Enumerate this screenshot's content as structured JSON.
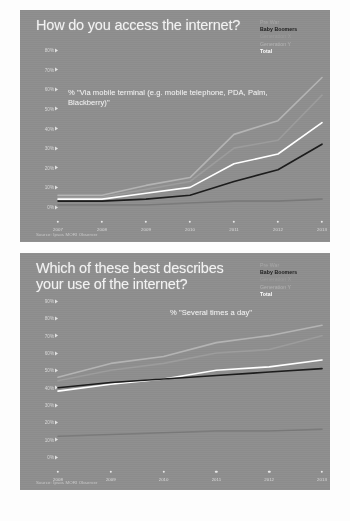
{
  "page": {
    "background_color": "#fdfdfd",
    "panel_color": "#8e8e8e"
  },
  "legend_colors": {
    "pre_war": "#a8a8a8",
    "baby_boomers": "#1c1c1c",
    "generation_x": "#9c9c9c",
    "generation_y": "#b4b4b4",
    "total": "#ffffff"
  },
  "slide1": {
    "title": "How do you access the internet?",
    "annotation": "% \"Via mobile terminal (e.g. mobile telephone, PDA, Palm, Blackberry)\"",
    "source": "Source: Ipsos MORI Observer",
    "legend": {
      "pre_war": "Pre War",
      "baby_boomers": "Baby Boomers",
      "generation_x": "Generation X",
      "generation_y": "Generation Y",
      "total": "Total"
    }
  },
  "slide2": {
    "title": "Which of these best describes your use of the internet?",
    "annotation": "% \"Several times a day\"",
    "source": "Source: Ipsos MORI Observer",
    "legend": {
      "pre_war": "Pre War",
      "baby_boomers": "Baby Boomers",
      "generation_x": "Generation X",
      "generation_y": "Generation Y",
      "total": "Total"
    }
  },
  "chart_data": [
    {
      "type": "line",
      "title": "How do you access the internet?",
      "subtitle": "% \"Via mobile terminal (e.g. mobile telephone, PDA, Palm, Blackberry)\"",
      "xlabel": "",
      "ylabel": "%",
      "x": [
        "2007",
        "2008",
        "2009",
        "2010",
        "2011",
        "2012",
        "2013"
      ],
      "categories": [
        "2007",
        "2008",
        "2009",
        "2010",
        "2011",
        "2012",
        "2013"
      ],
      "ylim": [
        0,
        80
      ],
      "yticks": [
        0,
        10,
        20,
        30,
        40,
        50,
        60,
        70,
        80
      ],
      "ytick_labels": [
        "0%",
        "10%",
        "20%",
        "30%",
        "40%",
        "50%",
        "60%",
        "70%",
        "80%"
      ],
      "grid": false,
      "legend_position": "top-right",
      "series": [
        {
          "name": "Generation Y",
          "color": "#b4b4b4",
          "values": [
            6,
            6,
            11,
            15,
            37,
            44,
            66
          ]
        },
        {
          "name": "Generation X",
          "color": "#9c9c9c",
          "values": [
            5,
            5,
            9,
            13,
            30,
            34,
            57
          ]
        },
        {
          "name": "Total",
          "color": "#ffffff",
          "values": [
            4,
            4,
            7,
            10,
            22,
            27,
            43
          ]
        },
        {
          "name": "Baby Boomers",
          "color": "#1c1c1c",
          "values": [
            3,
            3,
            4,
            6,
            13,
            19,
            32
          ]
        },
        {
          "name": "Pre War",
          "color": "#7a7a7a",
          "values": [
            1,
            1,
            1,
            2,
            3,
            3,
            4
          ]
        }
      ]
    },
    {
      "type": "line",
      "title": "Which of these best describes your use of the internet?",
      "subtitle": "% \"Several times a day\"",
      "xlabel": "",
      "ylabel": "%",
      "x": [
        "2008",
        "2009",
        "2010",
        "2011",
        "2012",
        "2013"
      ],
      "categories": [
        "2008",
        "2009",
        "2010",
        "2011",
        "2012",
        "2013"
      ],
      "ylim": [
        0,
        90
      ],
      "yticks": [
        0,
        10,
        20,
        30,
        40,
        50,
        60,
        70,
        80,
        90
      ],
      "ytick_labels": [
        "0%",
        "10%",
        "20%",
        "30%",
        "40%",
        "50%",
        "60%",
        "70%",
        "80%",
        "90%"
      ],
      "grid": false,
      "legend_position": "top-right",
      "series": [
        {
          "name": "Generation Y",
          "color": "#b4b4b4",
          "values": [
            46,
            54,
            58,
            66,
            70,
            76
          ]
        },
        {
          "name": "Generation X",
          "color": "#9c9c9c",
          "values": [
            44,
            50,
            54,
            60,
            62,
            70
          ]
        },
        {
          "name": "Total",
          "color": "#ffffff",
          "values": [
            38,
            42,
            45,
            50,
            52,
            56
          ]
        },
        {
          "name": "Baby Boomers",
          "color": "#1c1c1c",
          "values": [
            40,
            43,
            45,
            47,
            49,
            51
          ]
        },
        {
          "name": "Pre War",
          "color": "#7a7a7a",
          "values": [
            12,
            13,
            14,
            15,
            15,
            16
          ]
        }
      ]
    }
  ]
}
